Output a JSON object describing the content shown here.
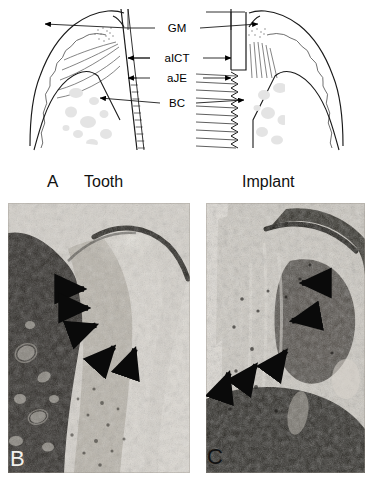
{
  "figure": {
    "panel_a": {
      "letter": "A",
      "left_title": "Tooth",
      "right_title": "Implant",
      "measurement_labels": [
        {
          "id": "gm",
          "text": "GM",
          "full_name": "gingival margin",
          "y": 28
        },
        {
          "id": "aict",
          "text": "aICT",
          "full_name": "area of infiltrated connective tissue",
          "y": 58
        },
        {
          "id": "aje",
          "text": "aJE",
          "full_name": "apical junctional epithelium",
          "y": 78
        },
        {
          "id": "bc",
          "text": "BC",
          "full_name": "bone crest",
          "y": 103
        }
      ]
    },
    "panel_b": {
      "letter": "B",
      "subject": "tooth",
      "arrow_count": 5,
      "arrows": [
        {
          "x": 72,
          "y": 86,
          "angle": 0
        },
        {
          "x": 76,
          "y": 104,
          "angle": 0
        },
        {
          "x": 84,
          "y": 124,
          "angle": -20
        },
        {
          "x": 103,
          "y": 146,
          "angle": -48
        },
        {
          "x": 124,
          "y": 152,
          "angle": -72
        }
      ]
    },
    "panel_c": {
      "letter": "C",
      "subject": "implant",
      "arrow_count": 5,
      "arrows": [
        {
          "x": 98,
          "y": 80,
          "angle": 180
        },
        {
          "x": 89,
          "y": 117,
          "angle": 168
        },
        {
          "x": 76,
          "y": 150,
          "angle": -50
        },
        {
          "x": 47,
          "y": 164,
          "angle": -50
        },
        {
          "x": 21,
          "y": 172,
          "angle": -72
        }
      ]
    }
  },
  "colors": {
    "ink": "#000000",
    "page_background": "#ffffff",
    "caption_text": "#111111",
    "panel_b_letter": "#f2f0ec",
    "panel_c_letter": "#111111",
    "diagram_stroke": "#1a1a1a",
    "diagram_light_stroke": "#8d8d8d",
    "marrow_fill": "#e2e2e2"
  }
}
